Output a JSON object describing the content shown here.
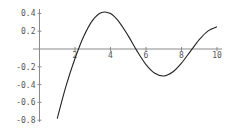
{
  "chart_data": {
    "type": "line",
    "title": "",
    "xlabel": "",
    "ylabel": "",
    "xlim": [
      0,
      10.3
    ],
    "ylim": [
      -0.8,
      0.42
    ],
    "grid": false,
    "legend": null,
    "x_ticks": [
      2,
      4,
      6,
      8,
      10
    ],
    "x_tick_labels": [
      "2",
      "4",
      "6",
      "8",
      "10"
    ],
    "y_ticks": [
      0.4,
      0.2,
      -0.2,
      -0.4,
      -0.6,
      -0.8
    ],
    "y_tick_labels": [
      "0.4",
      "0.2",
      "-0.2",
      "-0.4",
      "-0.6",
      "-0.8"
    ],
    "series": [
      {
        "name": "curve",
        "color": "#222222",
        "x": [
          1.0,
          1.5,
          2.0,
          2.5,
          3.0,
          3.5,
          4.0,
          4.5,
          5.0,
          5.5,
          6.0,
          6.5,
          7.0,
          7.5,
          8.0,
          8.5,
          9.0,
          9.5,
          10.0
        ],
        "y": [
          -0.7812,
          -0.4123,
          -0.107,
          0.1459,
          0.3247,
          0.4102,
          0.3979,
          0.3001,
          0.1479,
          -0.0238,
          -0.175,
          -0.2731,
          -0.3027,
          -0.2591,
          -0.1581,
          -0.0262,
          0.1043,
          0.2039,
          0.249
        ]
      }
    ]
  },
  "colors": {
    "axis": "#8a8a8a",
    "curve": "#222222",
    "labels": "#555555",
    "background": "#ffffff"
  }
}
